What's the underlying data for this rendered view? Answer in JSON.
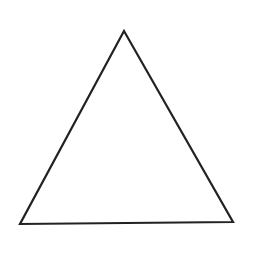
{
  "diagram": {
    "shape": "triangle",
    "kind": "equilateral-outline",
    "background_color": "#ffffff",
    "stroke_color": "#222222",
    "stroke_width": 2.2,
    "fill_color": "none",
    "vertices": {
      "apex": [
        124,
        31
      ],
      "bottom_left": [
        20,
        224
      ],
      "bottom_right": [
        233,
        222
      ]
    }
  }
}
